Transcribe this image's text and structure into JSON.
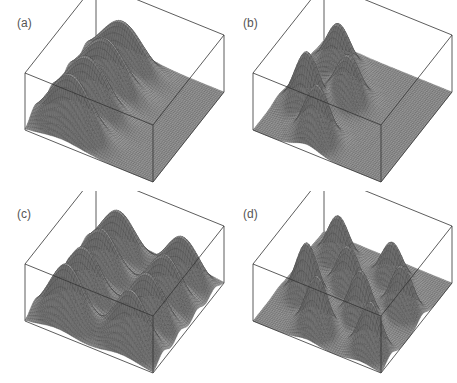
{
  "figure": {
    "background": "#ffffff",
    "line_color": "#333333",
    "surface_fill_light": "#bdbdbd",
    "surface_fill_dark": "#6e6e6e",
    "mesh_color": "#3a3a3a"
  },
  "panels": [
    {
      "label": "(a)",
      "left": 0,
      "top": 0
    },
    {
      "label": "(b)",
      "left": 228,
      "top": 0
    },
    {
      "label": "(c)",
      "left": 0,
      "top": 191
    },
    {
      "label": "(d)",
      "left": 228,
      "top": 191
    }
  ],
  "chart_data": [
    {
      "type": "surface",
      "title": "(a)",
      "description": "3D surface plot in a wireframe box: four elongated ridges side by side occupying the near-left half of the domain; remaining floor flat.",
      "grid": [
        60,
        60
      ],
      "xlabel": "",
      "ylabel": "",
      "zlabel": "",
      "ticks": "none",
      "peaks": [
        {
          "x": 0.14,
          "y": 0.28,
          "sx": 0.065,
          "sy": 0.16,
          "h": 0.8
        },
        {
          "x": 0.38,
          "y": 0.28,
          "sx": 0.065,
          "sy": 0.16,
          "h": 0.88
        },
        {
          "x": 0.62,
          "y": 0.28,
          "sx": 0.065,
          "sy": 0.16,
          "h": 0.94
        },
        {
          "x": 0.86,
          "y": 0.28,
          "sx": 0.065,
          "sy": 0.16,
          "h": 1.0
        }
      ]
    },
    {
      "type": "surface",
      "title": "(b)",
      "description": "3D surface plot: four localized peaks in a staggered 2x2 arrangement in the near-left half of the domain.",
      "grid": [
        60,
        60
      ],
      "xlabel": "",
      "ylabel": "",
      "zlabel": "",
      "ticks": "none",
      "peaks": [
        {
          "x": 0.2,
          "y": 0.22,
          "sx": 0.07,
          "sy": 0.09,
          "h": 0.8
        },
        {
          "x": 0.42,
          "y": 0.42,
          "sx": 0.07,
          "sy": 0.09,
          "h": 0.78
        },
        {
          "x": 0.64,
          "y": 0.22,
          "sx": 0.07,
          "sy": 0.09,
          "h": 1.0
        },
        {
          "x": 0.86,
          "y": 0.42,
          "sx": 0.07,
          "sy": 0.09,
          "h": 0.95
        }
      ]
    },
    {
      "type": "surface",
      "title": "(c)",
      "description": "3D surface plot: eight elongated ridges in a 4x2 arrangement covering the full domain.",
      "grid": [
        60,
        60
      ],
      "xlabel": "",
      "ylabel": "",
      "zlabel": "",
      "ticks": "none",
      "peaks": [
        {
          "x": 0.14,
          "y": 0.25,
          "sx": 0.065,
          "sy": 0.13,
          "h": 0.8
        },
        {
          "x": 0.38,
          "y": 0.25,
          "sx": 0.065,
          "sy": 0.13,
          "h": 0.86
        },
        {
          "x": 0.62,
          "y": 0.25,
          "sx": 0.065,
          "sy": 0.13,
          "h": 0.92
        },
        {
          "x": 0.86,
          "y": 0.25,
          "sx": 0.065,
          "sy": 0.13,
          "h": 1.0
        },
        {
          "x": 0.14,
          "y": 0.75,
          "sx": 0.065,
          "sy": 0.13,
          "h": 0.8
        },
        {
          "x": 0.38,
          "y": 0.75,
          "sx": 0.065,
          "sy": 0.13,
          "h": 0.86
        },
        {
          "x": 0.62,
          "y": 0.75,
          "sx": 0.065,
          "sy": 0.13,
          "h": 0.92
        },
        {
          "x": 0.86,
          "y": 0.75,
          "sx": 0.065,
          "sy": 0.13,
          "h": 1.0
        }
      ]
    },
    {
      "type": "surface",
      "title": "(d)",
      "description": "3D surface plot: eight localized sharp peaks in a staggered 4x2 arrangement covering the full domain.",
      "grid": [
        60,
        60
      ],
      "xlabel": "",
      "ylabel": "",
      "zlabel": "",
      "ticks": "none",
      "peaks": [
        {
          "x": 0.2,
          "y": 0.22,
          "sx": 0.06,
          "sy": 0.08,
          "h": 0.78
        },
        {
          "x": 0.42,
          "y": 0.42,
          "sx": 0.06,
          "sy": 0.08,
          "h": 0.78
        },
        {
          "x": 0.64,
          "y": 0.22,
          "sx": 0.06,
          "sy": 0.08,
          "h": 1.0
        },
        {
          "x": 0.86,
          "y": 0.42,
          "sx": 0.06,
          "sy": 0.08,
          "h": 0.95
        },
        {
          "x": 0.2,
          "y": 0.64,
          "sx": 0.06,
          "sy": 0.08,
          "h": 0.7
        },
        {
          "x": 0.42,
          "y": 0.84,
          "sx": 0.06,
          "sy": 0.08,
          "h": 0.82
        },
        {
          "x": 0.64,
          "y": 0.64,
          "sx": 0.06,
          "sy": 0.08,
          "h": 0.9
        },
        {
          "x": 0.86,
          "y": 0.84,
          "sx": 0.06,
          "sy": 0.08,
          "h": 0.88
        }
      ]
    }
  ]
}
